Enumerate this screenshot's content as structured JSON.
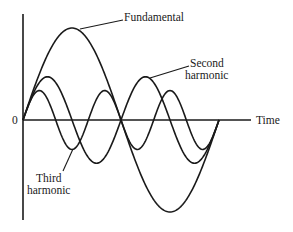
{
  "diagram": {
    "axis": {
      "origin_label": "0",
      "x_label": "Time"
    },
    "labels": {
      "fundamental": "Fundamental",
      "second_line1": "Second",
      "second_line2": "harmonic",
      "third_line1": "Third",
      "third_line2": "harmonic"
    },
    "waves": [
      {
        "name": "Fundamental",
        "cycles": 1,
        "relative_amplitude": 1.0
      },
      {
        "name": "Second harmonic",
        "cycles": 2,
        "relative_amplitude": 0.47
      },
      {
        "name": "Third harmonic",
        "cycles": 3,
        "relative_amplitude": 0.32
      }
    ],
    "colors": {
      "ink": "#1a1a1a",
      "background": "#ffffff"
    }
  }
}
